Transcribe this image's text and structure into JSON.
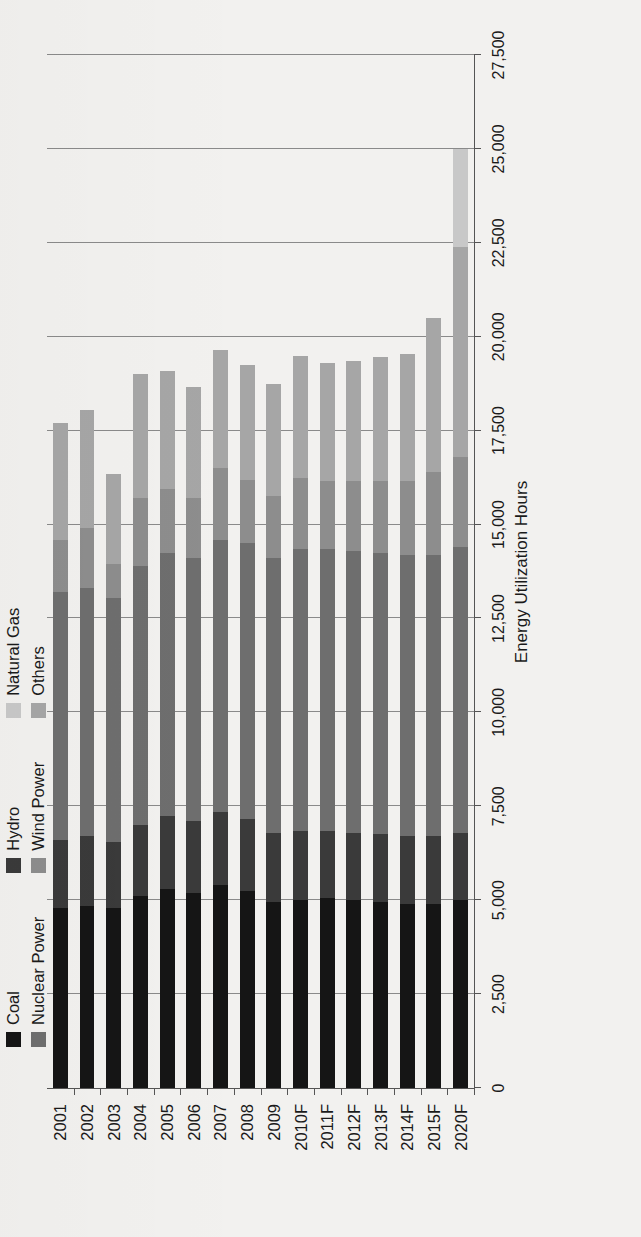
{
  "figure": {
    "caption": "",
    "background": "#f2f1ef"
  },
  "chart_data": {
    "type": "bar",
    "subtype": "stacked-horizontal",
    "title": "",
    "xlabel": "",
    "ylabel": "Energy Utilization Hours",
    "orientation": "rotated-90",
    "grid": true,
    "legend_position": "top-left",
    "ylim": [
      0,
      27500
    ],
    "ytick_step": 2500,
    "ytick_labels": [
      "27,500",
      "25,000",
      "22,500",
      "20,000",
      "17,500",
      "15,000",
      "12,500",
      "10,000",
      "7,500",
      "5,000",
      "2,500",
      "0"
    ],
    "ytick_values": [
      27500,
      25000,
      22500,
      20000,
      17500,
      15000,
      12500,
      10000,
      7500,
      5000,
      2500,
      0
    ],
    "categories": [
      "2001",
      "2002",
      "2003",
      "2004",
      "2005",
      "2006",
      "2007",
      "2008",
      "2009",
      "2010F",
      "2011F",
      "2012F",
      "2013F",
      "2014F",
      "2015F",
      "2020F"
    ],
    "categories_shown": [
      "2001",
      "2002",
      "2003",
      "2004",
      "2005",
      "2006",
      "2007",
      "2008",
      "2009",
      "2010F",
      "2011F",
      "2012F",
      "2013F",
      "2014F",
      "2015F",
      "2020F"
    ],
    "series": [
      {
        "name": "Coal",
        "color": "#151515",
        "values": [
          4800,
          4850,
          4800,
          5100,
          5300,
          5200,
          5400,
          5250,
          4950,
          5000,
          5050,
          5000,
          4950,
          4900,
          4900,
          5000
        ]
      },
      {
        "name": "Hydro",
        "color": "#3a3a3a",
        "values": [
          1800,
          1850,
          1750,
          1900,
          1950,
          1900,
          1950,
          1900,
          1850,
          1850,
          1800,
          1800,
          1800,
          1800,
          1800,
          1800
        ]
      },
      {
        "name": "Natural Gas",
        "color": "#c8c8c8",
        "values": [
          0,
          0,
          0,
          0,
          0,
          0,
          0,
          0,
          0,
          0,
          0,
          0,
          0,
          0,
          0,
          2600
        ]
      },
      {
        "name": "Nuclear Power",
        "color": "#6e6e6e",
        "values": [
          6600,
          6600,
          6500,
          6900,
          7000,
          7000,
          7250,
          7350,
          7300,
          7500,
          7500,
          7500,
          7500,
          7500,
          7500,
          7600
        ]
      },
      {
        "name": "Wind Power",
        "color": "#8d8d8d",
        "values": [
          1400,
          1600,
          900,
          1800,
          1700,
          1600,
          1900,
          1700,
          1650,
          1900,
          1800,
          1850,
          1900,
          1950,
          2200,
          2400
        ]
      },
      {
        "name": "Others",
        "color": "#a6a6a6",
        "values": [
          3100,
          3150,
          2400,
          3300,
          3150,
          2950,
          3150,
          3050,
          3000,
          3250,
          3150,
          3200,
          3300,
          3400,
          4100,
          5600
        ]
      }
    ],
    "totals": [
      17700,
      18050,
      16350,
      19000,
      19100,
      18650,
      19650,
      19250,
      18750,
      19500,
      19300,
      19350,
      19450,
      19550,
      20500,
      25000
    ],
    "stack_order": [
      "Coal",
      "Hydro",
      "Nuclear Power",
      "Wind Power",
      "Others",
      "Natural Gas"
    ],
    "note_natural_gas": "Natural Gas appears only in 2020F, drawn between Nuclear Power and the outer grey segments"
  },
  "legend": {
    "columns": [
      [
        {
          "label": "Coal",
          "color": "#151515",
          "swatch": "legend-swatch-coal"
        },
        {
          "label": "Nuclear Power",
          "color": "#6e6e6e",
          "swatch": "legend-swatch-nuclear-power"
        }
      ],
      [
        {
          "label": "Hydro",
          "color": "#3a3a3a",
          "swatch": "legend-swatch-hydro"
        },
        {
          "label": "Wind Power",
          "color": "#8d8d8d",
          "swatch": "legend-swatch-wind-power"
        }
      ],
      [
        {
          "label": "Natural Gas",
          "color": "#c8c8c8",
          "swatch": "legend-swatch-natural-gas"
        },
        {
          "label": "Others",
          "color": "#a6a6a6",
          "swatch": "legend-swatch-others"
        }
      ]
    ]
  }
}
